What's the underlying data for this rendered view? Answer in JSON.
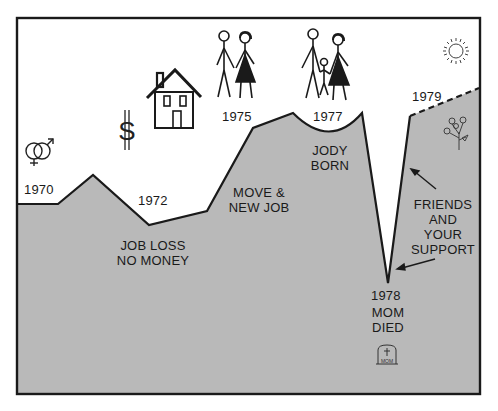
{
  "diagram": {
    "type": "life-line",
    "colors": {
      "fill": "#b9b9b9",
      "line": "#1a1a1a",
      "background": "#ffffff"
    },
    "milestones": [
      {
        "year": "1970",
        "caption": []
      },
      {
        "year": "1972",
        "caption": [
          "JOB LOSS",
          "NO MONEY"
        ]
      },
      {
        "year": "",
        "caption": [
          "MOVE &",
          "NEW JOB"
        ]
      },
      {
        "year": "1975",
        "caption": []
      },
      {
        "year": "1977",
        "caption": [
          "JODY",
          "BORN"
        ]
      },
      {
        "year": "1978",
        "caption": [
          "MOM",
          "DIED"
        ]
      },
      {
        "year": "1979",
        "caption": []
      }
    ],
    "support_label": [
      "FRIENDS",
      "AND",
      "YOUR",
      "SUPPORT"
    ],
    "tombstone_text": "MOM",
    "icons": [
      "gender-symbols-icon",
      "dollar-sign-icon",
      "house-icon",
      "couple-icon",
      "family-icon",
      "sun-icon",
      "flowers-icon",
      "tombstone-icon"
    ]
  }
}
